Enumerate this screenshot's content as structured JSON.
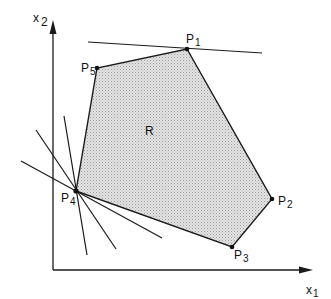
{
  "diagram": {
    "type": "feasible-region-polygon",
    "axes": {
      "x_label": "x",
      "x_sub": "1",
      "y_label": "x",
      "y_sub": "2"
    },
    "region_label": "R",
    "vertices": [
      {
        "id": "P1",
        "label": "P",
        "sub": "1",
        "x": 187,
        "y": 49
      },
      {
        "id": "P2",
        "label": "P",
        "sub": "2",
        "x": 272,
        "y": 199
      },
      {
        "id": "P3",
        "label": "P",
        "sub": "3",
        "x": 232,
        "y": 247
      },
      {
        "id": "P4",
        "label": "P",
        "sub": "4",
        "x": 76,
        "y": 191
      },
      {
        "id": "P5",
        "label": "P",
        "sub": "5",
        "x": 97,
        "y": 68
      }
    ],
    "supporting_lines": [
      {
        "through": "P1",
        "x1": 88,
        "y1": 42,
        "x2": 262,
        "y2": 53
      },
      {
        "through": "P4",
        "x1": 21,
        "y1": 161,
        "x2": 162,
        "y2": 238
      },
      {
        "through": "P4",
        "x1": 36,
        "y1": 130,
        "x2": 116,
        "y2": 249
      },
      {
        "through": "P4",
        "x1": 64,
        "y1": 116,
        "x2": 87,
        "y2": 255
      }
    ],
    "colors": {
      "region_fill": "#d6d6d6",
      "stroke": "#1a1a1a"
    }
  }
}
